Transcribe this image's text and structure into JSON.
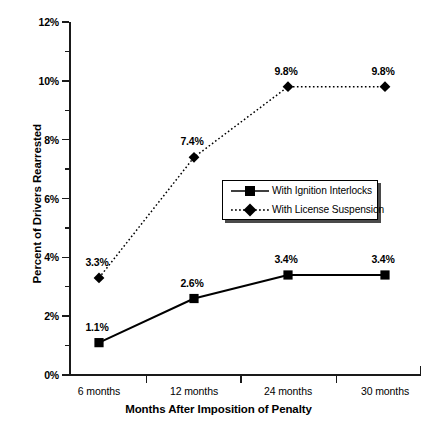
{
  "chart_data": {
    "type": "line",
    "title": "",
    "xlabel": "Months After Imposition of Penalty",
    "ylabel": "Percent of Drivers Rearrested",
    "categories": [
      "6 months",
      "12 months",
      "24 months",
      "30 months"
    ],
    "ylim": [
      0,
      12
    ],
    "yticks": [
      "0%",
      "2%",
      "4%",
      "6%",
      "8%",
      "10%",
      "12%"
    ],
    "ytick_values": [
      0,
      2,
      4,
      6,
      8,
      10,
      12
    ],
    "ytick_minor_values": [
      1,
      3,
      5,
      7,
      9,
      11
    ],
    "grid": false,
    "legend_position": "center-right-inside",
    "series": [
      {
        "name": "With Ignition Interlocks",
        "marker": "filled-square",
        "linestyle": "solid",
        "color": "#000000",
        "values": [
          1.1,
          2.6,
          3.4,
          3.4
        ],
        "labels": [
          "1.1%",
          "2.6%",
          "3.4%",
          "3.4%"
        ]
      },
      {
        "name": "With License Suspension",
        "marker": "filled-diamond",
        "linestyle": "dotted",
        "color": "#000000",
        "values": [
          3.3,
          7.4,
          9.8,
          9.8
        ],
        "labels": [
          "3.3%",
          "7.4%",
          "9.8%",
          "9.8%"
        ]
      }
    ]
  },
  "axes": {
    "y_title": "Percent of Drivers Rearrested",
    "x_title": "Months After Imposition of Penalty",
    "y_labels": [
      "12%",
      "10%",
      "8%",
      "6%",
      "4%",
      "2%",
      "0%"
    ],
    "x_labels": [
      "6 months",
      "12 months",
      "24 months",
      "30 months"
    ]
  },
  "legend": {
    "items": [
      {
        "label": "With Ignition Interlocks"
      },
      {
        "label": "With License Suspension"
      }
    ]
  },
  "labels": {
    "s0": [
      "1.1%",
      "2.6%",
      "3.4%",
      "3.4%"
    ],
    "s1": [
      "3.3%",
      "7.4%",
      "9.8%",
      "9.8%"
    ]
  }
}
